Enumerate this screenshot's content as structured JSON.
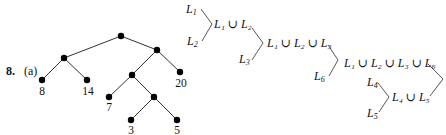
{
  "problem": {
    "number": "8.",
    "part": "(a)"
  },
  "tree": {
    "nodes": [
      {
        "id": "root",
        "x": 121,
        "y": 36,
        "label": ""
      },
      {
        "id": "left",
        "x": 64,
        "y": 58,
        "label": ""
      },
      {
        "id": "leaf8",
        "x": 42,
        "y": 80,
        "label": "8"
      },
      {
        "id": "leaf14",
        "x": 87,
        "y": 80,
        "label": "14"
      },
      {
        "id": "right",
        "x": 157,
        "y": 50,
        "label": ""
      },
      {
        "id": "leaf20",
        "x": 180,
        "y": 72,
        "label": "20"
      },
      {
        "id": "mid",
        "x": 132,
        "y": 75,
        "label": ""
      },
      {
        "id": "leaf7",
        "x": 109,
        "y": 97,
        "label": "7"
      },
      {
        "id": "lower",
        "x": 154,
        "y": 97,
        "label": ""
      },
      {
        "id": "leaf3",
        "x": 131,
        "y": 120,
        "label": "3"
      },
      {
        "id": "leaf5",
        "x": 177,
        "y": 120,
        "label": "5"
      }
    ],
    "edges": [
      [
        "root",
        "left"
      ],
      [
        "root",
        "right"
      ],
      [
        "left",
        "leaf8"
      ],
      [
        "left",
        "leaf14"
      ],
      [
        "right",
        "mid"
      ],
      [
        "right",
        "leaf20"
      ],
      [
        "mid",
        "leaf7"
      ],
      [
        "mid",
        "lower"
      ],
      [
        "lower",
        "leaf3"
      ],
      [
        "lower",
        "leaf5"
      ]
    ]
  },
  "merge": {
    "l1": "L",
    "l1_sub": "1",
    "l2": "L",
    "l2_sub": "2",
    "l3": "L",
    "l3_sub": "3",
    "l4": "L",
    "l4_sub": "4",
    "l5": "L",
    "l5_sub": "5",
    "l6": "L",
    "l6_sub": "6",
    "union": "∪",
    "u12": "L₁ ∪ L₂",
    "u123": "L₁ ∪ L₂ ∪ L₃",
    "u1236": "L₁ ∪ L₂ ∪ L₃ ∪ L₆",
    "u45": "L₄ ∪ L₅"
  }
}
